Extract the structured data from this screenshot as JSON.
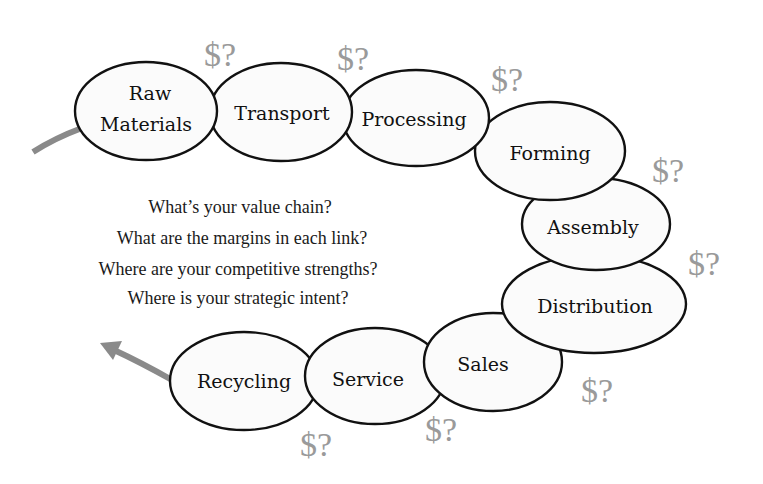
{
  "diagram": {
    "type": "value-chain",
    "links": [
      {
        "id": "raw-materials",
        "lines": [
          "Raw",
          "Materials"
        ]
      },
      {
        "id": "transport",
        "lines": [
          "Transport"
        ]
      },
      {
        "id": "processing",
        "lines": [
          "Processing"
        ]
      },
      {
        "id": "forming",
        "lines": [
          "Forming"
        ]
      },
      {
        "id": "assembly",
        "lines": [
          "Assembly"
        ]
      },
      {
        "id": "distribution",
        "lines": [
          "Distribution"
        ]
      },
      {
        "id": "sales",
        "lines": [
          "Sales"
        ]
      },
      {
        "id": "service",
        "lines": [
          "Service"
        ]
      },
      {
        "id": "recycling",
        "lines": [
          "Recycling"
        ]
      }
    ],
    "margin_marker": "$?",
    "questions": [
      "What’s your value chain?",
      "What are the margins in each link?",
      "Where are your competitive strengths?",
      "Where is your strategic intent?"
    ],
    "colors": {
      "ellipse_stroke": "#111111",
      "ellipse_fill": "#fbfbfb",
      "marker": "#9a9a9a",
      "arrow": "#8a8a8a",
      "text": "#111111"
    }
  }
}
